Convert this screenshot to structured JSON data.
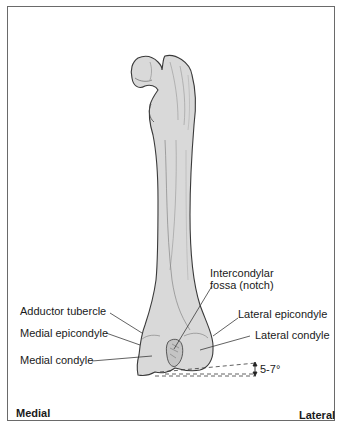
{
  "diagram": {
    "labels": {
      "intercondylar_fossa_line1": "Intercondylar",
      "intercondylar_fossa_line2": "fossa (notch)",
      "adductor_tubercle": "Adductor tubercle",
      "lateral_epicondyle": "Lateral epicondyle",
      "medial_epicondyle": "Medial epicondyle",
      "lateral_condyle": "Lateral condyle",
      "medial_condyle": "Medial condyle",
      "angle": "5-7°"
    },
    "orientation": {
      "left": "Medial",
      "right": "Lateral"
    },
    "colors": {
      "bone_fill": "#d9d9d9",
      "bone_outline": "#3a3a3a",
      "frame_border": "#6a6a6a",
      "text": "#1a1a1a"
    }
  }
}
